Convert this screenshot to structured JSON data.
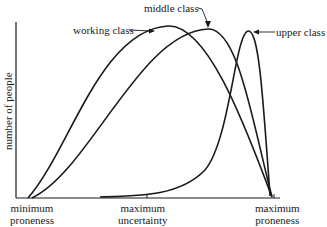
{
  "diagram": {
    "y_axis_label": "number of people",
    "x_axis": {
      "left_label_line1": "minimum",
      "left_label_line2": "proneness",
      "mid_label_line1": "maximum",
      "mid_label_line2": "uncertainty",
      "right_label_line1": "maximum",
      "right_label_line2": "proneness"
    },
    "curves": [
      {
        "name": "working class",
        "label": "working class"
      },
      {
        "name": "middle class",
        "label": "middle class"
      },
      {
        "name": "upper class",
        "label": "upper class"
      }
    ],
    "colors": {
      "line": "#1a1a1a",
      "background": "#ffffff"
    }
  }
}
